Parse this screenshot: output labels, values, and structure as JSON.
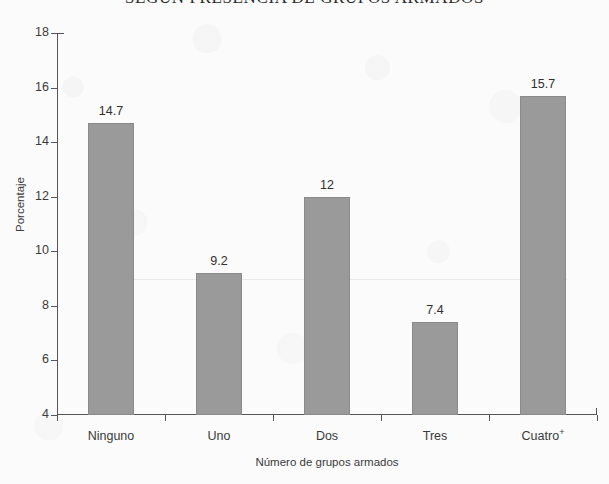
{
  "chart_data": {
    "type": "bar",
    "title": "SEGÚN PRESENCIA DE GRUPOS ARMADOS",
    "xlabel": "Número de grupos armados",
    "ylabel": "Porcentaje",
    "categories": [
      "Ninguno",
      "Uno",
      "Dos",
      "Tres",
      "Cuatro"
    ],
    "category_superscripts": [
      "",
      "",
      "",
      "",
      "+"
    ],
    "values": [
      14.7,
      9.2,
      12,
      7.4,
      15.7
    ],
    "value_labels": [
      "14.7",
      "9.2",
      "12",
      "7.4",
      "15.7"
    ],
    "ylim": [
      4,
      18
    ],
    "ytick_values": [
      4,
      6,
      8,
      10,
      12,
      14,
      16,
      18
    ],
    "ytick_labels": [
      "4",
      "6",
      "8",
      "10",
      "12",
      "14",
      "16",
      "18"
    ],
    "grid": false,
    "legend": "none",
    "bar_color": "#9a9a9a",
    "bar_border_color": "#8a8a8a",
    "axis_color": "#555555",
    "background_color": "#fbfbfb"
  }
}
